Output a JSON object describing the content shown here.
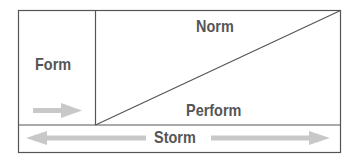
{
  "diagram": {
    "stages": {
      "form": "Form",
      "norm": "Norm",
      "perform": "Perform",
      "storm": "Storm"
    },
    "colors": {
      "line": "#555555",
      "text": "#555555",
      "arrow": "#c8c8c8",
      "background": "#ffffff"
    }
  }
}
